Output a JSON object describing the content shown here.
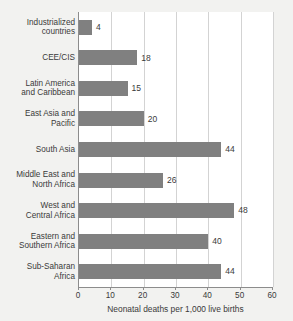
{
  "chart_data": {
    "type": "bar",
    "orientation": "horizontal",
    "title": "",
    "xlabel": "Neonatal deaths per 1,000 live births",
    "ylabel": "",
    "xlim": [
      0,
      60
    ],
    "xticks": [
      0,
      10,
      20,
      30,
      40,
      50,
      60
    ],
    "xtick_labels": [
      "0",
      "10",
      "20",
      "30",
      "40",
      "50",
      "60"
    ],
    "grid": "vertical",
    "legend": "none",
    "bar_color": "#808080",
    "plot_background": "#ffffff",
    "figure_background": "#f2f2f0",
    "gridline_color": "#d3d3d3",
    "axis_color": "#8c8c8c",
    "text_color": "#3a3a3a",
    "categories": [
      "Industrialized\ncountries",
      "CEE/CIS",
      "Latin America\nand Caribbean",
      "East Asia and\nPacific",
      "South Asia",
      "Middle East and\nNorth Africa",
      "West and\nCentral Africa",
      "Eastern and\nSouthern Africa",
      "Sub-Saharan\nAfrica"
    ],
    "values": [
      4,
      18,
      15,
      20,
      44,
      26,
      48,
      40,
      44
    ],
    "value_labels": [
      "4",
      "18",
      "15",
      "20",
      "44",
      "26",
      "48",
      "40",
      "44"
    ]
  }
}
